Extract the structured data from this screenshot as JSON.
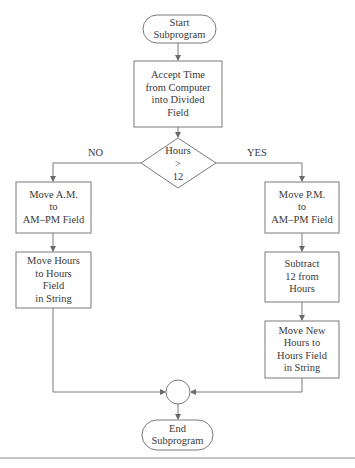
{
  "diagram": {
    "nodes": {
      "start": {
        "type": "terminator",
        "label": "Start\nSubprogram"
      },
      "accept_time": {
        "type": "process",
        "label": "Accept Time\nfrom Computer\ninto Divided\nField"
      },
      "decision": {
        "type": "decision",
        "label": "Hours\n>\n12"
      },
      "move_am": {
        "type": "process",
        "label": "Move A.M.\nto\nAM–PM Field"
      },
      "move_hours": {
        "type": "process",
        "label": "Move Hours\nto Hours\nField\nin String"
      },
      "move_pm": {
        "type": "process",
        "label": "Move P.M.\nto\nAM–PM Field"
      },
      "subtract": {
        "type": "process",
        "label": "Subtract\n12 from\nHours"
      },
      "move_new_hours": {
        "type": "process",
        "label": "Move New\nHours to\nHours Field\nin String"
      },
      "connector": {
        "type": "connector",
        "label": ""
      },
      "end": {
        "type": "terminator",
        "label": "End\nSubprogram"
      }
    },
    "edges": {
      "no_label": "NO",
      "yes_label": "YES"
    },
    "colors": {
      "stroke": "#7a7a7a",
      "text": "#3a3a3a",
      "rule": "#8a8a8a"
    }
  }
}
